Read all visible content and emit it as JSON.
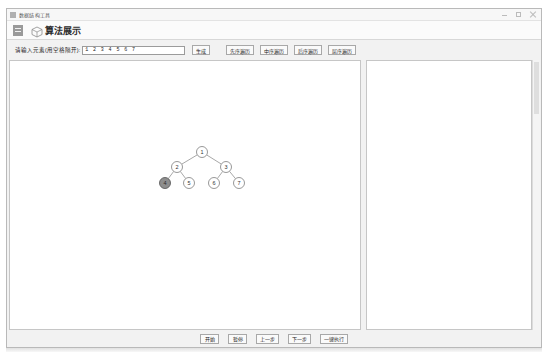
{
  "window": {
    "title": "数据结构工具",
    "controls": {
      "minimize": "minimize-icon",
      "maximize": "maximize-icon",
      "close": "close-icon"
    }
  },
  "header": {
    "menu_icon": "hamburger-menu-icon",
    "brand_icon": "cube-logo-icon",
    "app_title": "算法展示"
  },
  "toolbar": {
    "input_label": "请输入元素(用空格隔开):",
    "input_value": "1 2 3 4 5 6 7",
    "input_placeholder": "1 2 3 4 5 6 7",
    "generate_label": "生成",
    "traversals": [
      {
        "name": "preorder",
        "label": "先序遍历"
      },
      {
        "name": "inorder",
        "label": "中序遍历"
      },
      {
        "name": "postorder",
        "label": "后序遍历"
      },
      {
        "name": "levelorder",
        "label": "层序遍历"
      }
    ]
  },
  "canvas": {
    "tree": {
      "nodes": [
        {
          "id": "n1",
          "label": "1",
          "x": 192,
          "y": 91,
          "active": false
        },
        {
          "id": "n2",
          "label": "2",
          "x": 167,
          "y": 106,
          "active": false
        },
        {
          "id": "n3",
          "label": "3",
          "x": 216,
          "y": 106,
          "active": false
        },
        {
          "id": "n4",
          "label": "4",
          "x": 155,
          "y": 122,
          "active": true
        },
        {
          "id": "n5",
          "label": "5",
          "x": 179,
          "y": 122,
          "active": false
        },
        {
          "id": "n6",
          "label": "6",
          "x": 204,
          "y": 122,
          "active": false
        },
        {
          "id": "n7",
          "label": "7",
          "x": 229,
          "y": 122,
          "active": false
        }
      ],
      "edges": [
        {
          "from": "n1",
          "to": "n2"
        },
        {
          "from": "n1",
          "to": "n3"
        },
        {
          "from": "n2",
          "to": "n4"
        },
        {
          "from": "n2",
          "to": "n5"
        },
        {
          "from": "n3",
          "to": "n6"
        },
        {
          "from": "n3",
          "to": "n7"
        }
      ],
      "node_radius": 5.5,
      "active_node": "4"
    }
  },
  "output": {
    "text": ""
  },
  "footer": {
    "buttons": [
      {
        "name": "start",
        "label": "开始"
      },
      {
        "name": "pause",
        "label": "暂停"
      },
      {
        "name": "previous",
        "label": "上一步"
      },
      {
        "name": "next",
        "label": "下一步"
      },
      {
        "name": "run-all",
        "label": "一键执行"
      }
    ]
  },
  "colors": {
    "window_chrome": "#f2f2f2",
    "panel_bg": "#ffffff",
    "border": "#c6c6c6",
    "node_fill": "#ffffff",
    "node_stroke": "#8c8c8c",
    "node_active_fill": "#8e8e8e",
    "edge": "#9e9e9e"
  }
}
